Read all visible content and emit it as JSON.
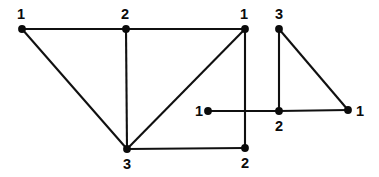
{
  "figure": {
    "kind": "graph-diagram",
    "background_color": "#ffffff",
    "ink_color": "#0b0b0b",
    "width": 379,
    "height": 177,
    "edge_stroke_width": 2.1,
    "vertex_radius": 3.9
  },
  "graphs": [
    {
      "id": "left-graph",
      "name": "left-graph",
      "vertices": [
        {
          "id": "L-a",
          "label": "1",
          "x": 22,
          "y": 29,
          "label_x": 21,
          "label_y": 19,
          "label_anchor": "middle"
        },
        {
          "id": "L-b",
          "label": "2",
          "x": 126,
          "y": 29,
          "label_x": 125,
          "label_y": 19,
          "label_anchor": "middle"
        },
        {
          "id": "L-c",
          "label": "1",
          "x": 245,
          "y": 29,
          "label_x": 244,
          "label_y": 19,
          "label_anchor": "middle"
        },
        {
          "id": "L-d",
          "label": "3",
          "x": 127,
          "y": 149,
          "label_x": 127,
          "label_y": 169,
          "label_anchor": "middle"
        },
        {
          "id": "L-e",
          "label": "2",
          "x": 245,
          "y": 148,
          "label_x": 245,
          "label_y": 168,
          "label_anchor": "middle"
        }
      ],
      "edges": [
        {
          "from": "L-a",
          "to": "L-b",
          "name": "edge-1-2-top-left"
        },
        {
          "from": "L-b",
          "to": "L-c",
          "name": "edge-2-1-top-right"
        },
        {
          "from": "L-a",
          "to": "L-d",
          "name": "edge-1-3-left-diagonal"
        },
        {
          "from": "L-b",
          "to": "L-d",
          "name": "edge-2-3-vertical"
        },
        {
          "from": "L-c",
          "to": "L-d",
          "name": "edge-1-3-inner-diagonal"
        },
        {
          "from": "L-c",
          "to": "L-e",
          "name": "edge-1-2-right-vertical"
        },
        {
          "from": "L-d",
          "to": "L-e",
          "name": "edge-3-2-bottom"
        }
      ]
    },
    {
      "id": "right-graph",
      "name": "right-graph",
      "vertices": [
        {
          "id": "R-a",
          "label": "3",
          "x": 279,
          "y": 29,
          "label_x": 279,
          "label_y": 19,
          "label_anchor": "middle"
        },
        {
          "id": "R-b",
          "label": "1",
          "x": 208,
          "y": 111,
          "label_x": 199,
          "label_y": 116,
          "label_anchor": "middle"
        },
        {
          "id": "R-c",
          "label": "2",
          "x": 279,
          "y": 111,
          "label_x": 279,
          "label_y": 131,
          "label_anchor": "middle"
        },
        {
          "id": "R-d",
          "label": "1",
          "x": 348,
          "y": 110,
          "label_x": 360,
          "label_y": 116,
          "label_anchor": "middle"
        }
      ],
      "edges": [
        {
          "from": "R-a",
          "to": "R-c",
          "name": "edge-3-2-vertical"
        },
        {
          "from": "R-a",
          "to": "R-d",
          "name": "edge-3-1-diagonal"
        },
        {
          "from": "R-b",
          "to": "R-c",
          "name": "edge-1-2-horizontal"
        },
        {
          "from": "R-c",
          "to": "R-d",
          "name": "edge-2-1-horizontal"
        }
      ]
    }
  ]
}
